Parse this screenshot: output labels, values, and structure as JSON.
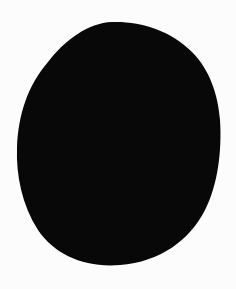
{
  "image": {
    "background_color": "#fcfcfc",
    "shape": {
      "kind": "irregular-oval-blob",
      "fill_color": "#080808"
    }
  }
}
